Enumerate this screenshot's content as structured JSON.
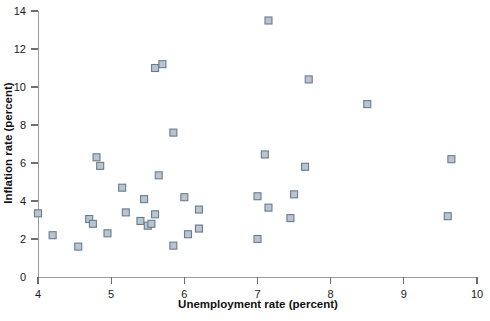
{
  "chart_data": {
    "type": "scatter",
    "title": "",
    "xlabel": "Unemployment rate (percent)",
    "ylabel": "Inflation rate (percent)",
    "xlim": [
      4,
      10
    ],
    "ylim": [
      0,
      14
    ],
    "xticks": [
      4,
      5,
      6,
      7,
      8,
      9,
      10
    ],
    "yticks": [
      0,
      2,
      4,
      6,
      8,
      10,
      12,
      14
    ],
    "xticklabels": [
      "4",
      "5",
      "6",
      "7",
      "8",
      "9",
      "10"
    ],
    "yticklabels": [
      "0",
      "2",
      "4",
      "6",
      "8",
      "10",
      "12",
      "14"
    ],
    "grid": false,
    "legend": null,
    "marker": {
      "shape": "square",
      "fill_color": "#b8c4d0",
      "edge_color": "#6b7c8c",
      "size": 7
    },
    "series": [
      {
        "name": "Unemployment vs Inflation",
        "points": [
          [
            4.0,
            3.35
          ],
          [
            4.2,
            2.2
          ],
          [
            4.55,
            1.6
          ],
          [
            4.7,
            3.05
          ],
          [
            4.75,
            2.8
          ],
          [
            4.8,
            6.3
          ],
          [
            4.85,
            5.85
          ],
          [
            4.95,
            2.3
          ],
          [
            5.15,
            4.7
          ],
          [
            5.2,
            3.4
          ],
          [
            5.4,
            2.95
          ],
          [
            5.45,
            4.1
          ],
          [
            5.5,
            2.7
          ],
          [
            5.55,
            2.8
          ],
          [
            5.6,
            3.3
          ],
          [
            5.6,
            11.0
          ],
          [
            5.65,
            5.35
          ],
          [
            5.7,
            11.2
          ],
          [
            5.85,
            1.65
          ],
          [
            5.85,
            7.6
          ],
          [
            6.0,
            4.2
          ],
          [
            6.05,
            2.25
          ],
          [
            6.2,
            2.55
          ],
          [
            6.2,
            3.55
          ],
          [
            7.0,
            2.0
          ],
          [
            7.0,
            4.25
          ],
          [
            7.1,
            6.45
          ],
          [
            7.15,
            3.65
          ],
          [
            7.15,
            13.5
          ],
          [
            7.45,
            3.1
          ],
          [
            7.5,
            4.35
          ],
          [
            7.65,
            5.8
          ],
          [
            7.7,
            10.4
          ],
          [
            8.5,
            9.1
          ],
          [
            9.6,
            3.2
          ],
          [
            9.65,
            6.2
          ]
        ]
      }
    ]
  },
  "axes": {
    "x_axis_name": "unemployment-rate-axis",
    "y_axis_name": "inflation-rate-axis"
  }
}
